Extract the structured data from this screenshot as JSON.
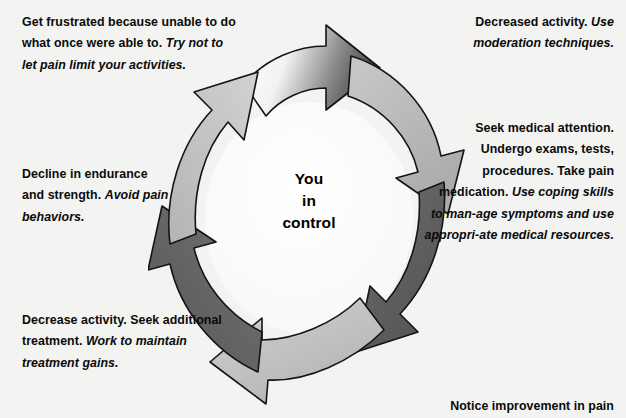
{
  "diagram": {
    "center": {
      "line1": "You",
      "line2": "in",
      "line3": "control"
    },
    "colors": {
      "background": "#f3f3f1",
      "arrow_light": "#b9b9b9",
      "arrow_dark": "#616161",
      "arrow_outline": "#141414",
      "text": "#0a0a0a",
      "inner_disc": "#fbfbfa"
    },
    "arrow_count": 6,
    "rotation": "clockwise",
    "arrows": [
      {
        "position": "top",
        "shade": "gradient-white-to-dark"
      },
      {
        "position": "upper-right",
        "shade": "light"
      },
      {
        "position": "lower-right",
        "shade": "dark"
      },
      {
        "position": "bottom",
        "shade": "light"
      },
      {
        "position": "lower-left",
        "shade": "dark"
      },
      {
        "position": "upper-left",
        "shade": "light"
      }
    ]
  },
  "labels": {
    "frustrated": {
      "bold": "Get frustrated because unable to do what once were able to.",
      "italic": "Try not to let pain limit your activities."
    },
    "decline": {
      "bold": "Decline in endurance and strength.",
      "italic": "Avoid pain behaviors."
    },
    "decrease": {
      "bold": "Decrease activity. Seek additional treatment.",
      "italic": "Work to maintain treatment gains."
    },
    "decreased_activity": {
      "bold": "Decreased activity.",
      "italic": "Use moderation techniques."
    },
    "seek_medical": {
      "bold": "Seek medical attention. Undergo exams, tests, procedures. Take pain medication.",
      "italic": "Use coping skills to man-age symptoms and use appropri-ate medical resources."
    },
    "notice": {
      "bold": "Notice improvement in pain"
    }
  }
}
